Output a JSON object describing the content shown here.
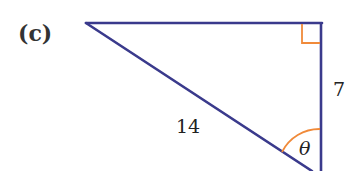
{
  "figure": {
    "part_label": "(c)",
    "shape": "right-triangle",
    "colors": {
      "lines": "#3a3a8c",
      "markers": "#f08a3a",
      "text": "#222222"
    },
    "labels": {
      "opposite_side": "7",
      "hypotenuse": "14",
      "angle": "θ"
    },
    "right_angle_marker": true,
    "angle_arc": true
  }
}
